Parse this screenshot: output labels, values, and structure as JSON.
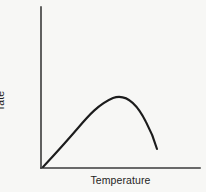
{
  "figure": {
    "background_color": "#f7f7f5",
    "axis_color": "#3a3a3a",
    "curve_color": "#1c1c1c",
    "y_label_line1": "Reaction",
    "y_label_line2": "rate",
    "x_label": "Temperature"
  },
  "chart_data": {
    "type": "line",
    "title": "",
    "subtitle": "",
    "xlabel": "Temperature",
    "ylabel": "Reaction rate",
    "grid": false,
    "legend": "none",
    "axis_ticks": {
      "x": [],
      "y": []
    },
    "axis_arrows": false,
    "xlim": [
      0,
      100
    ],
    "ylim": [
      0,
      100
    ],
    "annotations": [],
    "series": [
      {
        "name": "Reaction rate vs temperature",
        "x": [
          1.3,
          6,
          11,
          16,
          21,
          26,
          31,
          36,
          41,
          45,
          50,
          55,
          60,
          64,
          68,
          71,
          73,
          76,
          79,
          82,
          85,
          88,
          91,
          94,
          97,
          100,
          103,
          106,
          109,
          112,
          115,
          118,
          121,
          124,
          127,
          130,
          133,
          136,
          139,
          142,
          145
        ],
        "y": [
          2,
          8,
          14,
          20,
          26,
          32,
          37,
          42,
          47,
          51,
          55,
          59,
          63,
          66,
          68,
          70,
          71,
          72,
          73,
          74,
          75,
          75,
          76,
          76,
          76,
          75,
          74,
          73,
          71,
          68,
          65,
          61,
          57,
          52,
          47,
          42,
          36,
          30,
          24,
          18,
          12
        ]
      }
    ],
    "curve_path": "M 43 167 C 56 153, 66 142, 78 128 C 89 115, 99 104, 113 98 C 127 93, 138 106, 146 122 C 152 133, 155 142, 157 149",
    "peak_point": {
      "x": 113,
      "y": 98
    },
    "start_point": {
      "x": 43,
      "y": 167
    },
    "end_point": {
      "x": 157,
      "y": 149
    },
    "axes_geometry": {
      "y_axis": {
        "x": 41,
        "y_top": 7,
        "y_bottom": 168
      },
      "x_axis": {
        "y": 168,
        "x_left": 41,
        "x_right": 200
      }
    }
  }
}
